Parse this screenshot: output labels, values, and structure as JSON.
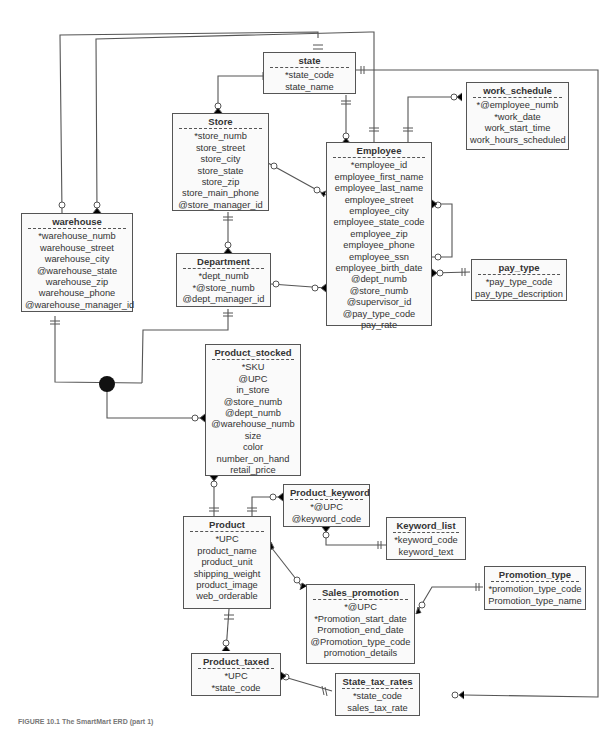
{
  "diagram": {
    "type": "Entity Relationship Diagram",
    "caption": "FIGURE 10.1 The SmartMart ERD (part 1)"
  },
  "entities": {
    "state": {
      "title": "state",
      "attrs": [
        "*state_code",
        "state_name"
      ]
    },
    "work_schedule": {
      "title": "work_schedule",
      "attrs": [
        "*@employee_numb",
        "*work_date",
        "work_start_time",
        "work_hours_scheduled"
      ]
    },
    "store": {
      "title": "Store",
      "attrs": [
        "*store_numb",
        "store_street",
        "store_city",
        "store_state",
        "store_zip",
        "store_main_phone",
        "@store_manager_id"
      ]
    },
    "employee": {
      "title": "Employee",
      "attrs": [
        "*employee_id",
        "employee_first_name",
        "employee_last_name",
        "employee_street",
        "employee_city",
        "employee_state_code",
        "employee_zip",
        "employee_phone",
        "employee_ssn",
        "employee_birth_date",
        "@dept_numb",
        "@store_numb",
        "@supervisor_id",
        "@pay_type_code",
        "pay_rate"
      ]
    },
    "warehouse": {
      "title": "warehouse",
      "attrs": [
        "*warehouse_numb",
        "warehouse_street",
        "warehouse_city",
        "@warehouse_state",
        "warehouse_zip",
        "warehouse_phone",
        "@warehouse_manager_id"
      ]
    },
    "department": {
      "title": "Department",
      "attrs": [
        "*dept_numb",
        "*@store_numb",
        "@dept_manager_id"
      ]
    },
    "pay_type": {
      "title": "pay_type",
      "attrs": [
        "*pay_type_code",
        "pay_type_description"
      ]
    },
    "product_stocked": {
      "title": "Product_stocked",
      "attrs": [
        "*SKU",
        "@UPC",
        "in_store",
        "@store_numb",
        "@dept_numb",
        "@warehouse_numb",
        "size",
        "color",
        "number_on_hand",
        "retail_price"
      ]
    },
    "product_keyword": {
      "title": "Product_keyword",
      "attrs": [
        "*@UPC",
        "@keyword_code"
      ]
    },
    "keyword_list": {
      "title": "Keyword_list",
      "attrs": [
        "*keyword_code",
        "keyword_text"
      ]
    },
    "product": {
      "title": "Product",
      "attrs": [
        "*UPC",
        "product_name",
        "product_unit",
        "shipping_weight",
        "product_image",
        "web_orderable"
      ]
    },
    "sales_promotion": {
      "title": "Sales_promotion",
      "attrs": [
        "*@UPC",
        "*Promotion_start_date",
        "Promotion_end_date",
        "@Promotion_type_code",
        "promotion_details"
      ]
    },
    "promotion_type": {
      "title": "Promotion_type",
      "attrs": [
        "*promotion_type_code",
        "Promotion_type_name"
      ]
    },
    "product_taxed": {
      "title": "Product_taxed",
      "attrs": [
        "*UPC",
        "*state_code"
      ]
    },
    "state_tax_rates": {
      "title": "State_tax_rates",
      "attrs": [
        "*state_code",
        "sales_tax_rate"
      ]
    }
  },
  "relationships": [
    {
      "from": "state",
      "to": "store",
      "from_card": "one",
      "to_card": "zero-or-many"
    },
    {
      "from": "state",
      "to": "employee",
      "from_card": "one",
      "to_card": "zero-or-many"
    },
    {
      "from": "state",
      "to": "warehouse",
      "from_card": "one",
      "to_card": "zero-or-many"
    },
    {
      "from": "employee",
      "to": "warehouse",
      "from_card": "one",
      "to_card": "zero-or-one"
    },
    {
      "from": "employee",
      "to": "work_schedule",
      "from_card": "one",
      "to_card": "zero-or-many"
    },
    {
      "from": "store",
      "to": "employee",
      "from_card": "zero-or-one",
      "to_card": "zero-or-many"
    },
    {
      "from": "store",
      "to": "department",
      "from_card": "one",
      "to_card": "zero-or-many"
    },
    {
      "from": "department",
      "to": "employee",
      "from_card": "zero-or-one",
      "to_card": "zero-or-many"
    },
    {
      "from": "employee",
      "to": "employee",
      "from_card": "zero-or-one",
      "to_card": "zero-or-many",
      "label": "supervisor"
    },
    {
      "from": "pay_type",
      "to": "employee",
      "from_card": "one",
      "to_card": "zero-or-many"
    },
    {
      "from": "warehouse",
      "to": "product_stocked",
      "from_card": "one",
      "to_card": "zero-or-many",
      "via": "exclusive-or"
    },
    {
      "from": "department",
      "to": "product_stocked",
      "from_card": "one",
      "to_card": "zero-or-many",
      "via": "exclusive-or"
    },
    {
      "from": "product",
      "to": "product_stocked",
      "from_card": "one",
      "to_card": "zero-or-many"
    },
    {
      "from": "product",
      "to": "product_keyword",
      "from_card": "one",
      "to_card": "zero-or-many"
    },
    {
      "from": "keyword_list",
      "to": "product_keyword",
      "from_card": "one",
      "to_card": "zero-or-many"
    },
    {
      "from": "product",
      "to": "sales_promotion",
      "from_card": "one-or-many",
      "to_card": "zero-or-many"
    },
    {
      "from": "promotion_type",
      "to": "sales_promotion",
      "from_card": "one",
      "to_card": "zero-or-many"
    },
    {
      "from": "product",
      "to": "product_taxed",
      "from_card": "one",
      "to_card": "zero-or-many"
    },
    {
      "from": "state_tax_rates",
      "to": "product_taxed",
      "from_card": "one",
      "to_card": "zero-or-many"
    },
    {
      "from": "state",
      "to": "state_tax_rates",
      "from_card": "one",
      "to_card": "zero-or-many"
    }
  ],
  "colors": {
    "line": "#555555",
    "box_fill": "#fafafa",
    "text": "#333333"
  }
}
